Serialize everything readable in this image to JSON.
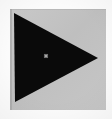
{
  "image": {
    "kind": "icon-glyph",
    "description": "Solid black right-pointing triangle (play symbol) on a light gray square panel",
    "width_px": 112,
    "height_px": 119,
    "alt_text": "Play triangle icon"
  },
  "canvas": {
    "outer_background_color": "#fbfbfb",
    "grain": "light"
  },
  "panel": {
    "name": "gray-panel",
    "fill_color": "#c2c2c2",
    "edge_shadow_color": "#9e9e9e",
    "left_px": 10,
    "top_px": 9,
    "width_px": 96,
    "height_px": 101
  },
  "glyph": {
    "name": "play-triangle",
    "direction": "right",
    "fill_color": "#0a0a0a",
    "vertices": [
      {
        "label": "top-left",
        "x": 4,
        "y": 4
      },
      {
        "label": "apex-right",
        "x": 88,
        "y": 49
      },
      {
        "label": "bottom-left",
        "x": 5,
        "y": 93
      }
    ]
  },
  "marker": {
    "name": "center-marker",
    "fill_color": "#6f6f6f",
    "core_color": "#a8a8a8",
    "left_px": 44,
    "top_px": 54,
    "size_px": 4
  }
}
